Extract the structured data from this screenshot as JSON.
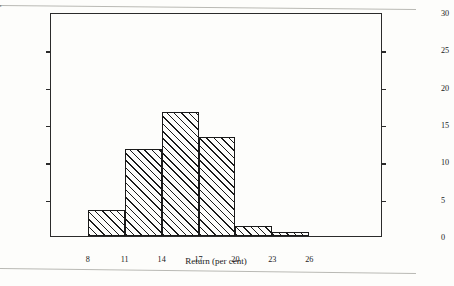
{
  "chart_data": {
    "type": "bar",
    "title": "",
    "xlabel": "Return (per cent)",
    "ylabel": "Frequency (Number of Trials)",
    "xlim": [
      5,
      32
    ],
    "ylim": [
      0,
      30
    ],
    "xtick_labels": [
      "8",
      "11",
      "14",
      "17",
      "20",
      "23",
      "26"
    ],
    "xtick_values": [
      8,
      11,
      14,
      17,
      20,
      23,
      26
    ],
    "ytick_labels": [
      "0",
      "5",
      "10",
      "15",
      "20",
      "25",
      "30"
    ],
    "ytick_values": [
      0,
      5,
      10,
      15,
      20,
      25,
      30
    ],
    "right_axis_tick_labels": [
      "0",
      "5",
      "10",
      "15",
      "20",
      "25",
      "30"
    ],
    "grid": false,
    "legend": false,
    "bin_edges": [
      8,
      11,
      14,
      17,
      20,
      23,
      26,
      29
    ],
    "bin_labels": [
      "8-11",
      "11-14",
      "14-17",
      "17-20",
      "20-23",
      "23-26",
      "26-29"
    ],
    "values": [
      3.5,
      11.7,
      16.6,
      13.3,
      1.4,
      0.5,
      0
    ],
    "bar_fill": "diagonal-hatch",
    "bar_edge_color": "#1a1a1a",
    "background_color": "#fdfdfb"
  },
  "axes": {
    "left_title": "Frequency (Number of Trials)",
    "bottom_title": "Return (per cent)"
  }
}
